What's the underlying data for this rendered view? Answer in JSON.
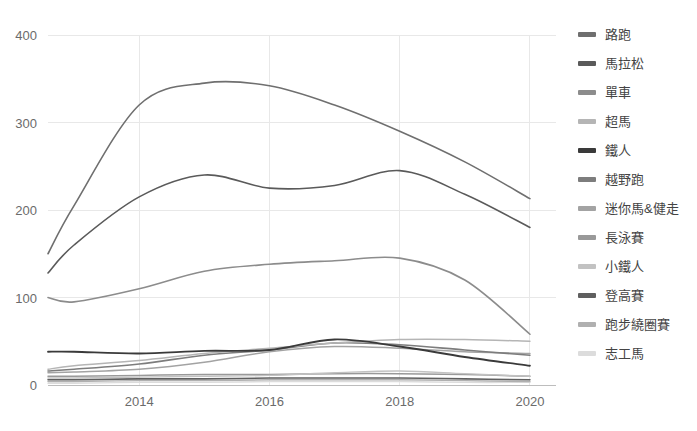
{
  "chart_data": {
    "type": "line",
    "title": "",
    "subtitle": "",
    "xlabel": "",
    "ylabel": "",
    "xlim": [
      2012.6,
      2020.4
    ],
    "ylim": [
      0,
      400
    ],
    "grid": true,
    "legend_position": "right",
    "x_ticks": [
      "2014",
      "2016",
      "2018",
      "2020"
    ],
    "x_tick_values": [
      2014,
      2016,
      2018,
      2020
    ],
    "y_ticks": [
      "0",
      "100",
      "200",
      "300",
      "400"
    ],
    "y_tick_values": [
      0,
      100,
      200,
      300,
      400
    ],
    "x": [
      2012.6,
      2013,
      2014,
      2015,
      2016,
      2017,
      2018,
      2019,
      2020
    ],
    "series": [
      {
        "name": "路跑",
        "color": "#6f6f6f",
        "width": 1.6,
        "values": [
          150,
          205,
          320,
          345,
          342,
          320,
          290,
          255,
          213
        ]
      },
      {
        "name": "馬拉松",
        "color": "#5a5a5a",
        "width": 1.6,
        "values": [
          128,
          160,
          215,
          240,
          225,
          228,
          245,
          218,
          180
        ]
      },
      {
        "name": "單車",
        "color": "#8c8c8c",
        "width": 1.6,
        "values": [
          100,
          95,
          110,
          130,
          138,
          142,
          145,
          120,
          58
        ]
      },
      {
        "name": "超馬",
        "color": "#b5b5b5",
        "width": 1.5,
        "values": [
          18,
          22,
          28,
          36,
          42,
          48,
          52,
          52,
          50
        ]
      },
      {
        "name": "鐵人",
        "color": "#3a3a3a",
        "width": 1.8,
        "values": [
          38,
          38,
          36,
          39,
          40,
          52,
          44,
          32,
          22
        ]
      },
      {
        "name": "越野跑",
        "color": "#7d7d7d",
        "width": 1.6,
        "values": [
          16,
          18,
          24,
          34,
          40,
          48,
          46,
          40,
          34
        ]
      },
      {
        "name": "迷你馬&健走",
        "color": "#a3a3a3",
        "width": 1.5,
        "values": [
          14,
          15,
          18,
          26,
          38,
          44,
          42,
          38,
          36
        ]
      },
      {
        "name": "長泳賽",
        "color": "#999999",
        "width": 1.5,
        "values": [
          10,
          10,
          11,
          12,
          12,
          13,
          13,
          12,
          10
        ]
      },
      {
        "name": "小鐵人",
        "color": "#c2c2c2",
        "width": 1.4,
        "values": [
          8,
          8,
          9,
          10,
          11,
          14,
          16,
          13,
          10
        ]
      },
      {
        "name": "登高賽",
        "color": "#5f5f5f",
        "width": 1.6,
        "values": [
          6,
          6,
          7,
          7,
          8,
          8,
          8,
          7,
          6
        ]
      },
      {
        "name": "跑步繞圈賽",
        "color": "#b0b0b0",
        "width": 1.4,
        "values": [
          4,
          4,
          5,
          5,
          6,
          6,
          6,
          5,
          4
        ]
      },
      {
        "name": "志工馬",
        "color": "#dcdcdc",
        "width": 1.4,
        "values": [
          2,
          2,
          3,
          3,
          4,
          4,
          4,
          3,
          3
        ]
      }
    ]
  },
  "legend": {
    "items": [
      {
        "label": "路跑",
        "color": "#6f6f6f"
      },
      {
        "label": "馬拉松",
        "color": "#5a5a5a"
      },
      {
        "label": "單車",
        "color": "#8c8c8c"
      },
      {
        "label": "超馬",
        "color": "#b5b5b5"
      },
      {
        "label": "鐵人",
        "color": "#3a3a3a"
      },
      {
        "label": "越野跑",
        "color": "#7d7d7d"
      },
      {
        "label": "迷你馬&健走",
        "color": "#a3a3a3"
      },
      {
        "label": "長泳賽",
        "color": "#999999"
      },
      {
        "label": "小鐵人",
        "color": "#c2c2c2"
      },
      {
        "label": "登高賽",
        "color": "#5f5f5f"
      },
      {
        "label": "跑步繞圈賽",
        "color": "#b0b0b0"
      },
      {
        "label": "志工馬",
        "color": "#dcdcdc"
      }
    ]
  },
  "colors": {
    "gridline": "#e8e8e8",
    "axis": "#bdbdbd",
    "tick_label": "#6b6b6b",
    "legend_label": "#444444",
    "background": "#ffffff"
  }
}
